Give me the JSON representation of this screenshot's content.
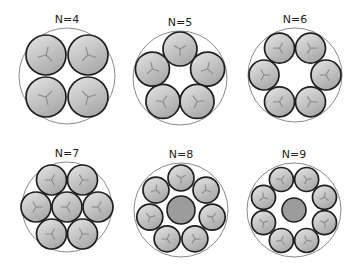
{
  "figure": {
    "colors": {
      "outer_stroke": "#8a8a8a",
      "inner_stroke": "#1e1e1e",
      "fill_light": "#e6e6e6",
      "fill_dark": "#a9a9a9",
      "core_fill": "#9c9c9c",
      "spoke": "#8a8a8a"
    },
    "panels": [
      {
        "label": "N=4",
        "n": 4,
        "cx": 67,
        "cy": 76,
        "R": 48,
        "circles": [
          [
            -21,
            -21,
            20
          ],
          [
            21,
            -21,
            20
          ],
          [
            -21,
            21,
            20
          ],
          [
            21,
            21,
            20
          ]
        ],
        "core": null
      },
      {
        "label": "N=5",
        "n": 5,
        "cx": 180,
        "cy": 78,
        "R": 47,
        "ring": {
          "count": 5,
          "radius": 29,
          "r": 17,
          "start_deg": -90
        },
        "core": null
      },
      {
        "label": "N=6",
        "n": 6,
        "cx": 295,
        "cy": 75,
        "R": 47,
        "ring": {
          "count": 6,
          "radius": 31,
          "r": 15,
          "start_deg": -120
        },
        "core": null
      },
      {
        "label": "N=7",
        "n": 7,
        "cx": 67,
        "cy": 207,
        "R": 45,
        "circles": [
          [
            0,
            0,
            15
          ],
          [
            -15.5,
            -27,
            15
          ],
          [
            15.5,
            -27,
            15
          ],
          [
            -31,
            0,
            15
          ],
          [
            31,
            0,
            15
          ],
          [
            -15.5,
            27,
            15
          ],
          [
            15.5,
            27,
            15
          ]
        ],
        "core": null
      },
      {
        "label": "N=8",
        "n": 8,
        "cx": 181,
        "cy": 210,
        "R": 47,
        "ring": {
          "count": 7,
          "radius": 32,
          "r": 13,
          "start_deg": -90
        },
        "core": {
          "r": 14
        }
      },
      {
        "label": "N=9",
        "n": 9,
        "cx": 294,
        "cy": 210,
        "R": 47,
        "ring": {
          "count": 8,
          "radius": 33,
          "r": 12,
          "start_deg": -112.5
        },
        "core": {
          "r": 12
        }
      }
    ]
  }
}
